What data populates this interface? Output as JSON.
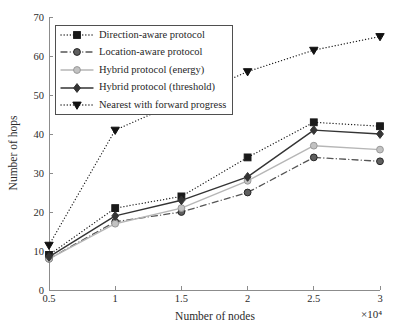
{
  "figure": {
    "background": "#ffffff",
    "axis_color": "#8c8c8c",
    "text_color": "#2b2b2b",
    "legend_border_color": "#4f4f4f"
  },
  "chart_data": {
    "type": "line",
    "title": "",
    "xlabel": "Number of nodes",
    "ylabel": "Number of hops",
    "x_axis_multiplier_label": "×10⁴",
    "xlim": [
      0.5,
      3
    ],
    "ylim": [
      0,
      70
    ],
    "x_ticks": [
      "0.5",
      "1",
      "1.5",
      "2",
      "2.5",
      "3"
    ],
    "x_tick_values": [
      0.5,
      1,
      1.5,
      2,
      2.5,
      3
    ],
    "y_ticks": [
      "0",
      "10",
      "20",
      "30",
      "40",
      "50",
      "60",
      "70"
    ],
    "y_tick_values": [
      0,
      10,
      20,
      30,
      40,
      50,
      60,
      70
    ],
    "grid": false,
    "legend_position": "top-left",
    "x": [
      0.5,
      1,
      1.5,
      2,
      2.5,
      3
    ],
    "series": [
      {
        "name": "Direction-aware protocol",
        "marker": "square",
        "line_style": "dotted",
        "color": "#1a1a1a",
        "marker_fill": "#1a1a1a",
        "marker_edge": "#1a1a1a",
        "values": [
          9,
          21,
          24,
          34,
          43,
          42
        ]
      },
      {
        "name": "Location-aware protocol",
        "marker": "circle",
        "line_style": "dashdot",
        "color": "#555555",
        "marker_fill": "#5f5f5f",
        "marker_edge": "#262626",
        "values": [
          8,
          17.5,
          20,
          25,
          34,
          33
        ]
      },
      {
        "name": "Hybrid protocol (energy)",
        "marker": "circle",
        "line_style": "solid",
        "color": "#b6b6b6",
        "marker_fill": "#c2c2c2",
        "marker_edge": "#999999",
        "values": [
          8,
          17,
          21,
          28,
          37,
          36
        ]
      },
      {
        "name": "Hybrid protocol (threshold)",
        "marker": "diamond",
        "line_style": "solid",
        "color": "#343434",
        "marker_fill": "#343434",
        "marker_edge": "#343434",
        "values": [
          8.5,
          19,
          23,
          29,
          41,
          40
        ]
      },
      {
        "name": "Nearest with forward progress",
        "marker": "triangle-down",
        "line_style": "dotted",
        "color": "#1a1a1a",
        "marker_fill": "#111111",
        "marker_edge": "#111111",
        "values": [
          11.5,
          41,
          48.5,
          56,
          61.5,
          65
        ]
      }
    ]
  }
}
